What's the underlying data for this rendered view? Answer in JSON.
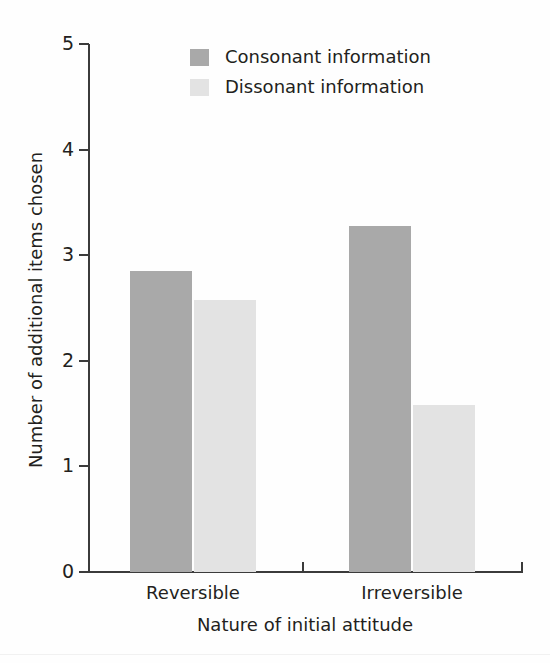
{
  "chart_data": {
    "type": "bar",
    "title": "",
    "xlabel": "Nature of initial attitude",
    "ylabel": "Number of additional items chosen",
    "categories": [
      "Reversible",
      "Irreversible"
    ],
    "series": [
      {
        "name": "Consonant information",
        "color": "#a9a9a9",
        "values": [
          2.85,
          3.28
        ]
      },
      {
        "name": "Dissonant information",
        "color": "#e3e3e3",
        "values": [
          2.58,
          1.58
        ]
      }
    ],
    "ylim": [
      0,
      5
    ],
    "yticks": [
      0,
      1,
      2,
      3,
      4,
      5
    ],
    "ytick_labels": [
      "0",
      "1",
      "2",
      "3",
      "4",
      "5"
    ],
    "grid": false,
    "legend_position": "top-center"
  },
  "axes": {
    "y_title": "Number of additional items chosen",
    "x_title": "Nature of initial attitude"
  },
  "legend": {
    "entries": [
      {
        "label": "Consonant information",
        "swatch": "#a9a9a9"
      },
      {
        "label": "Dissonant information",
        "swatch": "#e3e3e3"
      }
    ]
  }
}
